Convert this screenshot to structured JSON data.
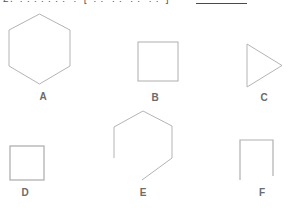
{
  "page": {
    "background_color": "#ffffff",
    "shape_stroke_color": "#b4b4b4",
    "label_color": "#6b6b6b",
    "answer_blank_color": "#4a4a4a"
  },
  "header": {
    "clipped_text_approx": "2. ??????? ?  [ ?? ?? ?? ?? ]",
    "answer_blank_present": true
  },
  "shapes": [
    {
      "id": "A",
      "label": "A",
      "type": "hexagon",
      "complete": true,
      "description": "regular hexagon, pointed top and bottom"
    },
    {
      "id": "B",
      "label": "B",
      "type": "square",
      "complete": true,
      "description": "square outline"
    },
    {
      "id": "C",
      "label": "C",
      "type": "triangle",
      "complete": true,
      "description": "right-pointing triangle"
    },
    {
      "id": "D",
      "label": "D",
      "type": "square",
      "complete": true,
      "description": "small square outline"
    },
    {
      "id": "E",
      "label": "E",
      "type": "hexagon",
      "complete": false,
      "description": "open hexagon missing lower-left edge"
    },
    {
      "id": "F",
      "label": "F",
      "type": "square",
      "complete": false,
      "description": "open square missing bottom edge"
    }
  ]
}
